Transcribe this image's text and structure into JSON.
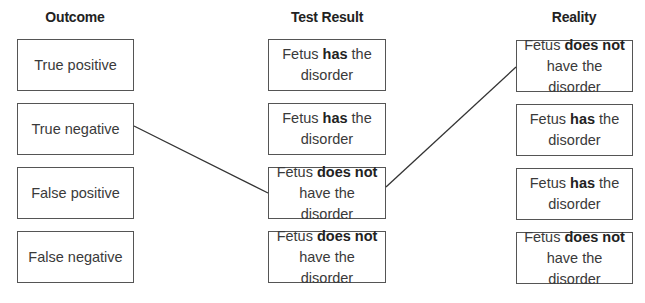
{
  "headers": {
    "outcome": "Outcome",
    "test_result": "Test Result",
    "reality": "Reality"
  },
  "outcome": [
    {
      "label": "True positive"
    },
    {
      "label": "True negative"
    },
    {
      "label": "False positive"
    },
    {
      "label": "False negative"
    }
  ],
  "test_result": [
    {
      "pre": "Fetus ",
      "bold": "has",
      "post": " the disorder"
    },
    {
      "pre": "Fetus ",
      "bold": "has",
      "post": " the disorder"
    },
    {
      "pre": "Fetus ",
      "bold": "does not",
      "post": " have the disorder"
    },
    {
      "pre": "Fetus ",
      "bold": "does not",
      "post": " have the disorder"
    }
  ],
  "reality": [
    {
      "pre": "Fetus ",
      "bold": "does not",
      "post": " have the disorder"
    },
    {
      "pre": "Fetus ",
      "bold": "has",
      "post": " the disorder"
    },
    {
      "pre": "Fetus ",
      "bold": "has",
      "post": " the disorder"
    },
    {
      "pre": "Fetus ",
      "bold": "does not",
      "post": " have the disorder"
    }
  ],
  "connections": [
    {
      "from": "outcome.1",
      "to": "test_result.2"
    },
    {
      "from": "test_result.2",
      "to": "reality.0"
    }
  ],
  "colors": {
    "border": "#555555",
    "line": "#333333",
    "text": "#3a3a3a"
  }
}
